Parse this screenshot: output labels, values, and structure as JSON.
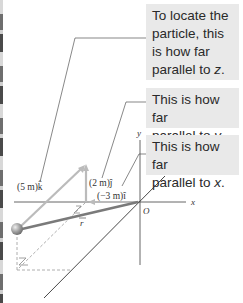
{
  "callouts": {
    "z": {
      "line1": "To locate the",
      "line2": "particle, this",
      "line3": "is how far",
      "line4_prefix": "parallel to ",
      "axis": "z",
      "line4_suffix": "."
    },
    "y": {
      "line1": "This is how far",
      "line2_prefix": "parallel to ",
      "axis": "y",
      "line2_suffix": "."
    },
    "x": {
      "line1": "This is how far",
      "line2_prefix": "parallel to ",
      "axis": "x",
      "line2_suffix": "."
    }
  },
  "components": {
    "k": "(5 m)k̂",
    "j": "(2 m)ĵ",
    "i": "(−3 m)î"
  },
  "vector_label": "r",
  "axes": {
    "x": "x",
    "y": "y",
    "origin": "O"
  },
  "colors": {
    "callout_bg": "#e9e9e9",
    "component_arrow": "#b8b8b8",
    "position_vector": "#7a7a7a",
    "axis": "#555555"
  }
}
